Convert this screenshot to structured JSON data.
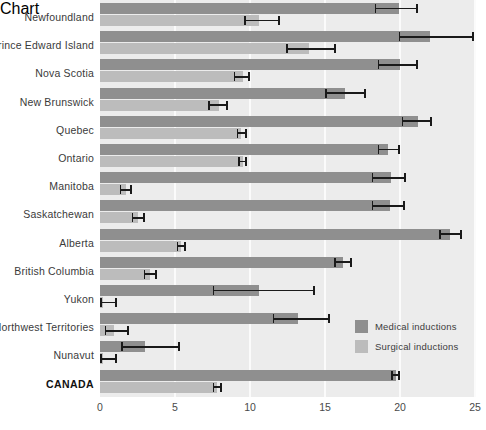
{
  "chart_data": {
    "type": "bar",
    "orientation": "horizontal",
    "title": "",
    "xlabel": "",
    "ylabel": "",
    "xlim": [
      0,
      25
    ],
    "xticks": [
      "0",
      "5",
      "10",
      "15",
      "20",
      "25"
    ],
    "grid": true,
    "legend_position": "inside-right",
    "categories": [
      "Newfoundland",
      "Prince Edward Island",
      "Nova Scotia",
      "New Brunswick",
      "Quebec",
      "Ontario",
      "Manitoba",
      "Saskatchewan",
      "Alberta",
      "British Columbia",
      "Yukon",
      "Northwest Territories",
      "Nunavut",
      "CANADA"
    ],
    "emphasized_category": "CANADA",
    "series": [
      {
        "name": "Medical inductions",
        "color": "#8f8f8f",
        "values": [
          19.9,
          22.0,
          20.0,
          16.3,
          21.2,
          19.2,
          19.4,
          19.3,
          23.3,
          16.2,
          10.6,
          13.2,
          3.0,
          19.7
        ],
        "ci_low": [
          18.3,
          19.9,
          18.5,
          15.0,
          20.1,
          18.5,
          18.1,
          18.1,
          22.6,
          15.6,
          7.5,
          11.5,
          1.4,
          19.4
        ],
        "ci_high": [
          21.2,
          24.9,
          21.2,
          17.7,
          22.1,
          20.0,
          20.4,
          20.3,
          24.1,
          16.8,
          14.3,
          15.3,
          5.3,
          20.0
        ]
      },
      {
        "name": "Surgical inductions",
        "color": "#bcbcbc",
        "values": [
          10.6,
          13.9,
          9.5,
          7.9,
          9.4,
          9.5,
          1.7,
          2.5,
          5.4,
          3.3,
          0.2,
          0.9,
          0.2,
          7.8
        ],
        "ci_low": [
          9.6,
          12.4,
          8.9,
          7.2,
          9.1,
          9.2,
          1.3,
          2.1,
          5.1,
          2.9,
          0.0,
          0.3,
          0.0,
          7.5
        ],
        "ci_high": [
          12.0,
          15.7,
          10.0,
          8.5,
          9.8,
          9.8,
          2.1,
          3.0,
          5.7,
          3.8,
          1.1,
          1.9,
          1.1,
          8.1
        ]
      }
    ]
  },
  "legend": {
    "items": [
      {
        "label": "Medical inductions",
        "swatch": "medical"
      },
      {
        "label": "Surgical inductions",
        "swatch": "surgical"
      }
    ]
  },
  "footnote": ""
}
